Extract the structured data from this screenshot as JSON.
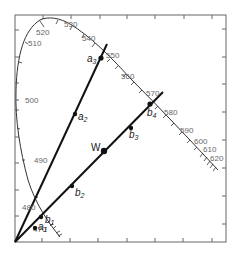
{
  "diagram": {
    "type": "chromaticity-diagram",
    "frame": {
      "left": 15,
      "top": 15,
      "right": 226,
      "bottom": 242
    },
    "colors": {
      "frame": "#666666",
      "locus": "#333333",
      "line": "#111111",
      "text": "#666666"
    },
    "wavelength_labels": [
      {
        "text": "470",
        "x": 33,
        "y": 232
      },
      {
        "text": "480",
        "x": 22,
        "y": 210
      },
      {
        "text": "490",
        "x": 34,
        "y": 163
      },
      {
        "text": "500",
        "x": 25,
        "y": 103
      },
      {
        "text": "510",
        "x": 28,
        "y": 46
      },
      {
        "text": "520",
        "x": 36,
        "y": 35
      },
      {
        "text": "530",
        "x": 64,
        "y": 27
      },
      {
        "text": "540",
        "x": 82,
        "y": 41
      },
      {
        "text": "550",
        "x": 106,
        "y": 58
      },
      {
        "text": "560",
        "x": 121,
        "y": 79
      },
      {
        "text": "570",
        "x": 146,
        "y": 96
      },
      {
        "text": "580",
        "x": 164,
        "y": 115
      },
      {
        "text": "590",
        "x": 180,
        "y": 133
      },
      {
        "text": "600",
        "x": 194,
        "y": 144
      },
      {
        "text": "610",
        "x": 203,
        "y": 152
      },
      {
        "text": "620",
        "x": 210,
        "y": 161
      }
    ],
    "points": [
      {
        "id": "a1",
        "base": "a",
        "sub": "1",
        "x": 35,
        "y": 228,
        "lx": 38,
        "ly": 228
      },
      {
        "id": "a2",
        "base": "a",
        "sub": "2",
        "x": 75,
        "y": 114,
        "lx": 78,
        "ly": 118
      },
      {
        "id": "a3",
        "base": "a",
        "sub": "3",
        "x": 101,
        "y": 58,
        "lx": 87,
        "ly": 62
      },
      {
        "id": "b1",
        "base": "b",
        "sub": "1",
        "x": 41,
        "y": 217,
        "lx": 45,
        "ly": 222
      },
      {
        "id": "b2",
        "base": "b",
        "sub": "2",
        "x": 72,
        "y": 186,
        "lx": 75,
        "ly": 196
      },
      {
        "id": "W",
        "base": "W",
        "sub": "",
        "x": 104,
        "y": 151,
        "lx": 91,
        "ly": 150
      },
      {
        "id": "b3",
        "base": "b",
        "sub": "3",
        "x": 131,
        "y": 128,
        "lx": 129,
        "ly": 138
      },
      {
        "id": "b4",
        "base": "b",
        "sub": "4",
        "x": 150,
        "y": 104,
        "lx": 148,
        "ly": 116
      }
    ],
    "lines": [
      {
        "name": "line-a",
        "x1": 15,
        "y1": 242,
        "x2": 107,
        "y2": 44
      },
      {
        "name": "line-b",
        "x1": 15,
        "y1": 242,
        "x2": 163,
        "y2": 92
      }
    ]
  }
}
